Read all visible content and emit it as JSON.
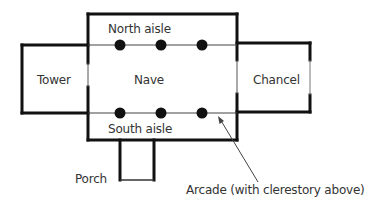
{
  "diagram": {
    "labels": {
      "north_aisle": "North aisle",
      "tower": "Tower",
      "nave": "Nave",
      "chancel": "Chancel",
      "south_aisle": "South aisle",
      "porch": "Porch",
      "arcade": "Arcade (with clerestory above)"
    },
    "arcades": {
      "north": {
        "pillars": 3
      },
      "south": {
        "pillars": 3
      }
    },
    "colors": {
      "wall": "#111111",
      "arcade_line": "#444444",
      "text": "#333333",
      "background": "#ffffff"
    }
  }
}
